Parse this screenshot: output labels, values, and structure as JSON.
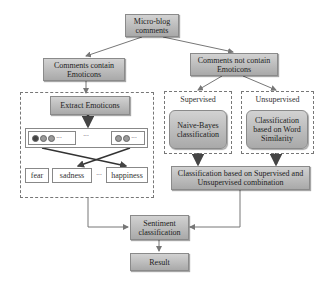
{
  "diagram": {
    "nodes": {
      "root": "Micro-blog comments",
      "with_emoticons": "Comments contain Emoticons",
      "without_emoticons": "Comments  not contain Emoticons",
      "extract": "Extract Emoticons",
      "supervised_label": "Supervised",
      "unsupervised_label": "Unsupervised",
      "naive_bayes": "Naive-Bayes classification",
      "word_similarity": "Classification based on Word Similarity",
      "combination": "Classification based on Supervised and Unsupervised combination",
      "sentiment": "Sentiment classification",
      "result": "Result"
    },
    "emoticon_groups": {
      "ellipsis": "···"
    },
    "emotions": [
      "fear",
      "sadness",
      "···",
      "happiness"
    ]
  },
  "colors": {
    "box_fill_top": "#d2d2d2",
    "box_fill_bottom": "#a9a9a9",
    "arrow": "#777777",
    "thick_arrow": "#555555"
  }
}
